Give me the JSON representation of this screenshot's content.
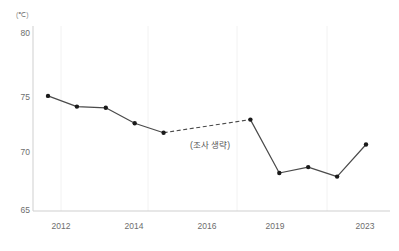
{
  "chart_data": {
    "type": "line",
    "title": "",
    "subtitle": "",
    "xlabel": "",
    "ylabel": "",
    "unit_label": "(℃)",
    "x": [
      2012,
      2013,
      2014,
      2015,
      2016,
      2019,
      2020,
      2021,
      2022,
      2023
    ],
    "values": [
      74.7,
      73.8,
      73.7,
      72.4,
      71.6,
      72.7,
      68.2,
      68.7,
      67.9,
      70.6
    ],
    "series": [
      {
        "name": "",
        "categories": [
          2012,
          2013,
          2014,
          2015,
          2016,
          2019,
          2020,
          2021,
          2022,
          2023
        ],
        "values": [
          74.7,
          73.8,
          73.7,
          72.4,
          71.6,
          72.7,
          68.2,
          68.7,
          67.9,
          70.6
        ]
      }
    ],
    "ylim": [
      65,
      80
    ],
    "xlim": [
      2012,
      2023
    ],
    "ytick_labels": [
      "80",
      "75",
      "70",
      "65"
    ],
    "ytick_values": [
      80,
      75,
      70,
      65
    ],
    "xtick_labels": [
      "2012",
      "2014",
      "2016",
      "2019",
      "2023"
    ],
    "xtick_values": [
      2012,
      2014,
      2016,
      2019,
      2023
    ],
    "grid": "vertical-faint",
    "legend": "none",
    "gap_segment": {
      "from_year": 2016,
      "to_year": 2019,
      "style": "dashed",
      "annotation": "(조사 생략)"
    },
    "colors": {
      "line": "#4a4a4a",
      "marker": "#1a1a1a",
      "axis": "#cccccc",
      "grid": "#f0f0f0",
      "tick_text": "#6d6d6d",
      "unit_text": "#8a8a8a",
      "annotation_text": "#555555"
    }
  }
}
